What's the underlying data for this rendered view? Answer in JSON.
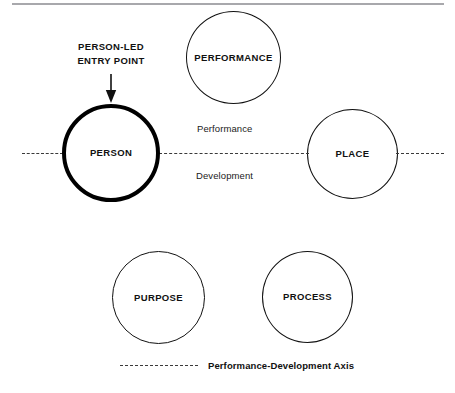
{
  "diagram": {
    "nodes": [
      {
        "id": "person",
        "label": "PERSON",
        "emphasis": true,
        "center_x": 111,
        "center_y": 153
      },
      {
        "id": "performance",
        "label": "PERFORMANCE",
        "emphasis": false,
        "center_x": 233,
        "center_y": 58
      },
      {
        "id": "place",
        "label": "PLACE",
        "emphasis": false,
        "center_x": 352,
        "center_y": 154
      },
      {
        "id": "purpose",
        "label": "PURPOSE",
        "emphasis": false,
        "center_x": 158,
        "center_y": 298
      },
      {
        "id": "process",
        "label": "PROCESS",
        "emphasis": false,
        "center_x": 307,
        "center_y": 297
      }
    ],
    "axis": {
      "pole_upper_label": "Performance",
      "pole_lower_label": "Development",
      "style": "dashed",
      "color": "#3a3a3a"
    },
    "annotation": {
      "line1": "PERSON-LED",
      "line2": "ENTRY POINT",
      "arrow_direction": "down",
      "points_to": "person"
    },
    "legend": {
      "swatch_style": "dashed",
      "label": "Performance-Development Axis"
    },
    "colors": {
      "stroke": "#111111",
      "emphasis_stroke": "#000000",
      "dash": "#3a3a3a",
      "top_rule": "#a8a8ac",
      "background": "#ffffff"
    }
  }
}
